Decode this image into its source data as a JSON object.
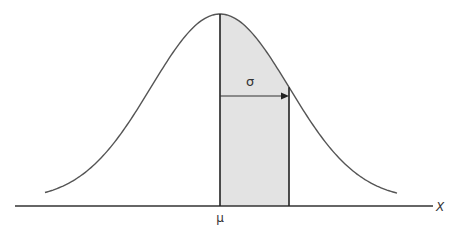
{
  "diagram": {
    "labels": {
      "mean": "μ",
      "sigma": "σ",
      "x_axis": "X"
    },
    "colors": {
      "curve": "#555555",
      "axis": "#333333",
      "shade": "#e3e3e3",
      "lines": "#222222"
    },
    "geometry": {
      "mean_px": 220,
      "sigma_px": 69,
      "peak_y": 14,
      "baseline_y": 206
    }
  }
}
